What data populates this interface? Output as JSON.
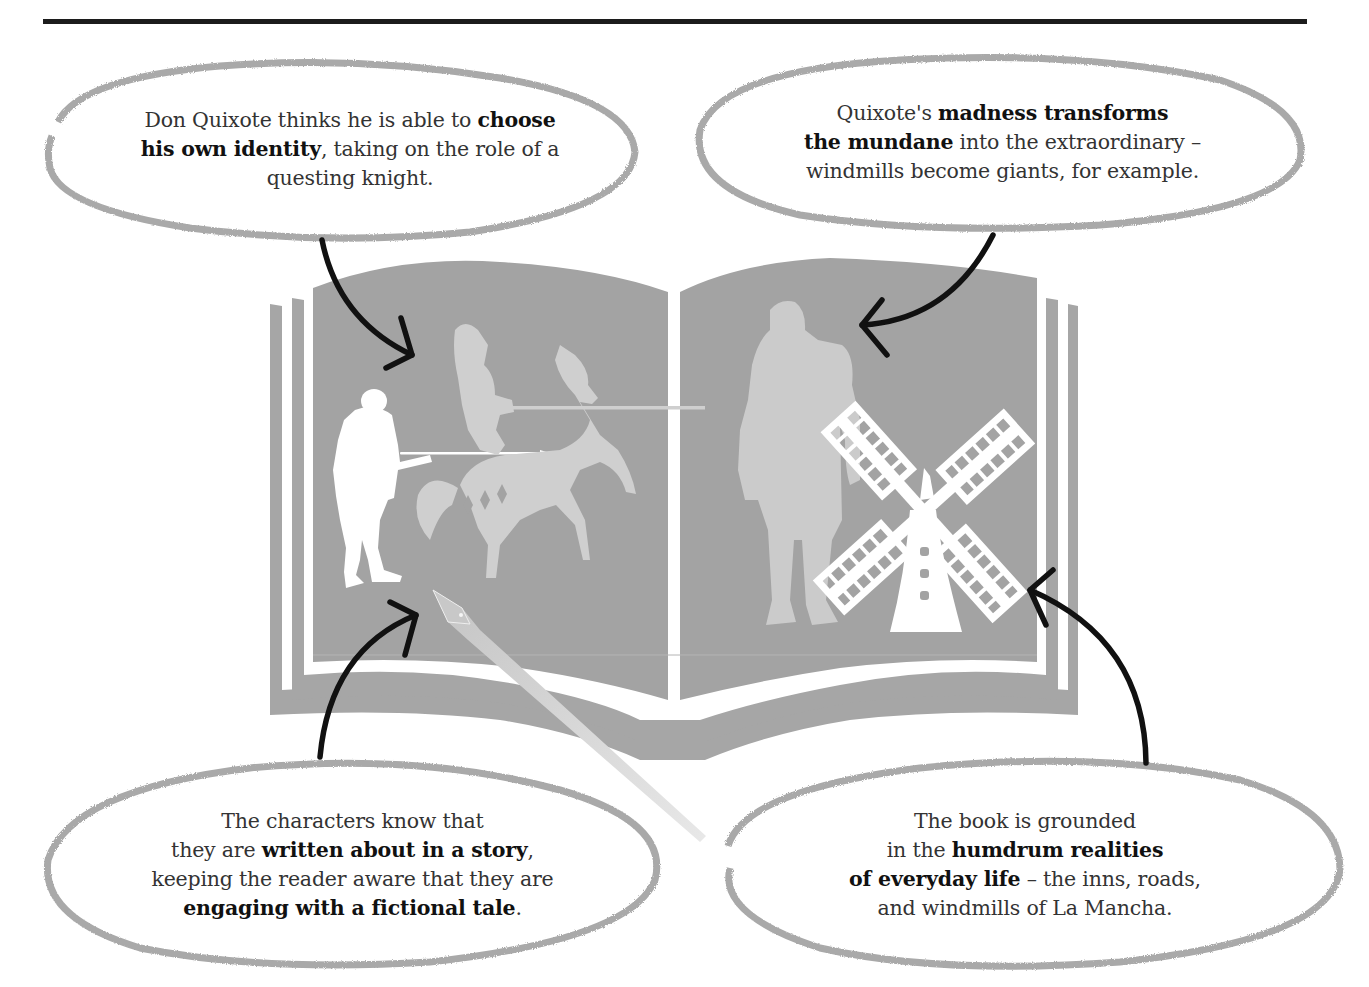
{
  "figure": {
    "colors": {
      "rule": "#1c1c1c",
      "book": "#a3a3a3",
      "figure_light": "#cfcfcf",
      "figure_white": "#ffffff",
      "bubble_outline": "#a9a9a9",
      "arrow": "#111111",
      "text": "#333333"
    }
  },
  "callouts": [
    {
      "id": "choose-identity",
      "lines": [
        [
          {
            "t": "Don Quixote thinks he is able to ",
            "b": false
          },
          {
            "t": "choose",
            "b": true
          }
        ],
        [
          {
            "t": "his own identity",
            "b": true
          },
          {
            "t": ", taking on the role of a",
            "b": false
          }
        ],
        [
          {
            "t": "questing knight.",
            "b": false
          }
        ]
      ],
      "arrow_target": "knight-on-horse"
    },
    {
      "id": "madness-transforms",
      "lines": [
        [
          {
            "t": "Quixote's ",
            "b": false
          },
          {
            "t": "madness transforms",
            "b": true
          }
        ],
        [
          {
            "t": "the mundane",
            "b": true
          },
          {
            "t": " into the extraordinary –",
            "b": false
          }
        ],
        [
          {
            "t": "windmills become giants, for example.",
            "b": false
          }
        ]
      ],
      "arrow_target": "giant"
    },
    {
      "id": "written-about",
      "lines": [
        [
          {
            "t": "The characters know that",
            "b": false
          }
        ],
        [
          {
            "t": "they are ",
            "b": false
          },
          {
            "t": "written about in a story",
            "b": true
          },
          {
            "t": ",",
            "b": false
          }
        ],
        [
          {
            "t": "keeping the reader aware that they are",
            "b": false
          }
        ],
        [
          {
            "t": "engaging with a fictional tale",
            "b": true
          },
          {
            "t": ".",
            "b": false
          }
        ]
      ],
      "arrow_target": "pen"
    },
    {
      "id": "humdrum-realities",
      "lines": [
        [
          {
            "t": "The book is grounded",
            "b": false
          }
        ],
        [
          {
            "t": "in the ",
            "b": false
          },
          {
            "t": "humdrum realities",
            "b": true
          }
        ],
        [
          {
            "t": "of everyday life",
            "b": true
          },
          {
            "t": " – the inns, roads,",
            "b": false
          }
        ],
        [
          {
            "t": "and windmills of La Mancha.",
            "b": false
          }
        ]
      ],
      "arrow_target": "windmill"
    }
  ],
  "illustrations": [
    "open-book",
    "man-with-lance",
    "knight-on-horse",
    "pen-nib",
    "giant",
    "windmill"
  ]
}
